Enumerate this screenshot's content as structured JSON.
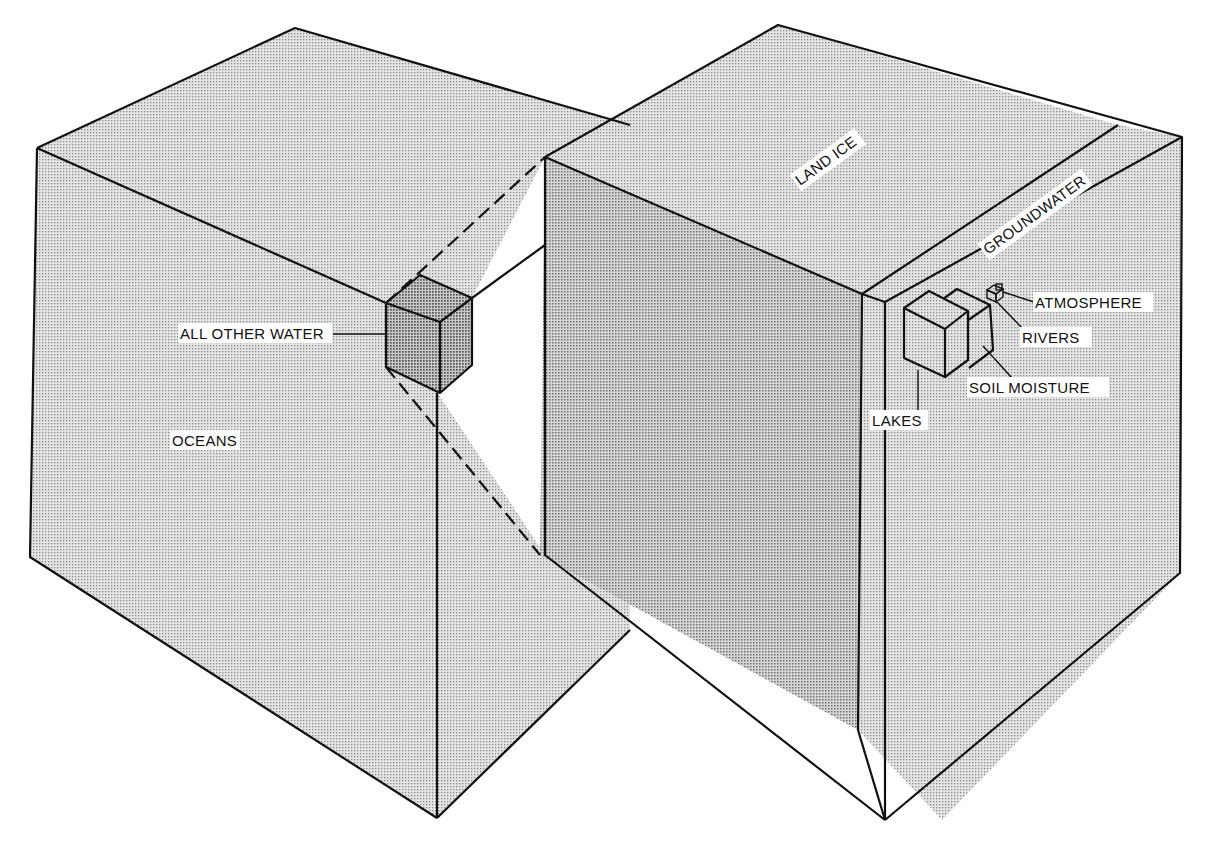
{
  "diagram": {
    "type": "isometric-volume-comparison",
    "colors": {
      "background": "#ffffff",
      "stipple_light": "#d9d9d9",
      "stipple_dark": "#c4c4c4",
      "line": "#111111"
    },
    "blocks": {
      "oceans": {
        "label": "OCEANS"
      },
      "all_other_water": {
        "label": "ALL OTHER WATER"
      },
      "land_ice": {
        "label": "LAND ICE"
      },
      "groundwater": {
        "label": "GROUNDWATER"
      },
      "lakes": {
        "label": "LAKES"
      },
      "soil_moisture": {
        "label": "SOIL MOISTURE"
      },
      "rivers": {
        "label": "RIVERS"
      },
      "atmosphere": {
        "label": "ATMOSPHERE"
      }
    }
  }
}
